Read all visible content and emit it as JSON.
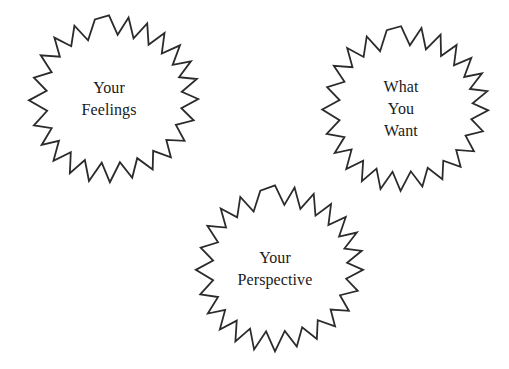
{
  "canvas": {
    "width": 509,
    "height": 369,
    "background_color": "#ffffff",
    "stroke_color": "#2b2b2b",
    "text_color": "#1a1a1a"
  },
  "diagram": {
    "type": "starburst-shapes",
    "shape_count": 3,
    "shapes": [
      {
        "name": "your-feelings",
        "points": 24,
        "lines": [
          "Your",
          "Feelings"
        ],
        "text": "Your Feelings",
        "center_x": 109,
        "center_y": 99
      },
      {
        "name": "what-you-want",
        "points": 24,
        "lines": [
          "What",
          "You",
          "Want"
        ],
        "text": "What You Want",
        "center_x": 401,
        "center_y": 109
      },
      {
        "name": "your-perspective",
        "points": 24,
        "lines": [
          "Your",
          "Perspective"
        ],
        "text": "Your Perspective",
        "center_x": 275,
        "center_y": 269
      }
    ]
  }
}
